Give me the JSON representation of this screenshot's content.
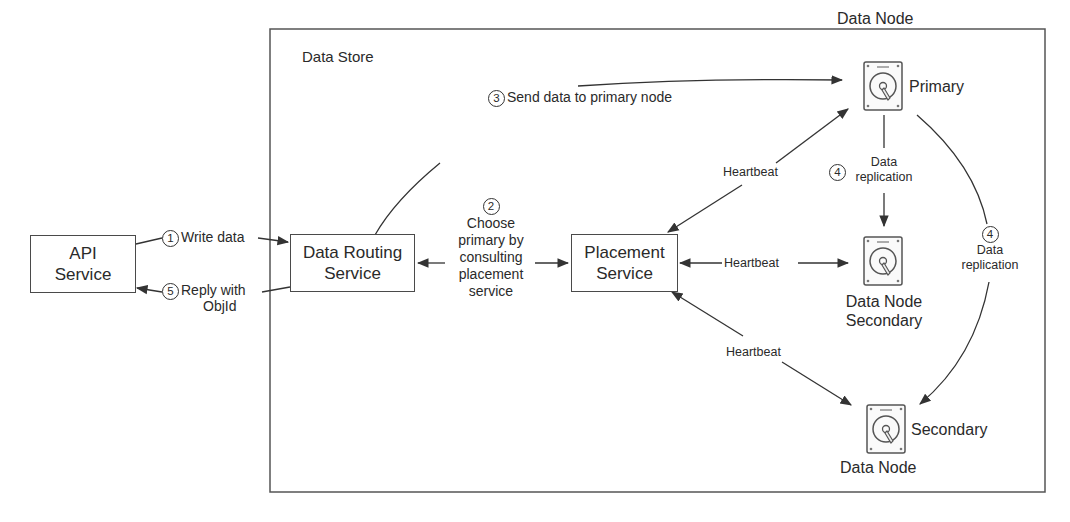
{
  "diagram": {
    "title": "Data Store",
    "nodes": {
      "api_service": {
        "line1": "API",
        "line2": "Service"
      },
      "data_routing": {
        "line1": "Data Routing",
        "line2": "Service"
      },
      "placement": {
        "line1": "Placement",
        "line2": "Service"
      },
      "primary": {
        "title": "Data Node",
        "role": "Primary",
        "icon": "hard-disk-icon"
      },
      "secondary_1": {
        "title": "Data Node",
        "role": "Secondary",
        "icon": "hard-disk-icon"
      },
      "secondary_2": {
        "title": "Data Node",
        "role": "Secondary",
        "icon": "hard-disk-icon"
      }
    },
    "edges": {
      "write": {
        "step": "1",
        "label": "Write data"
      },
      "choose": {
        "step": "2",
        "line1": "Choose",
        "line2": "primary by",
        "line3": "consulting",
        "line4": "placement",
        "line5": "service"
      },
      "send": {
        "step": "3",
        "label": "Send data to primary node"
      },
      "replication_1": {
        "step": "4",
        "line1": "Data",
        "line2": "replication"
      },
      "replication_2": {
        "step": "4",
        "line1": "Data",
        "line2": "replication"
      },
      "reply": {
        "step": "5",
        "line1": "Reply with",
        "line2": "ObjId"
      },
      "heartbeat_primary": {
        "label": "Heartbeat"
      },
      "heartbeat_secondary_1": {
        "label": "Heartbeat"
      },
      "heartbeat_secondary_2": {
        "label": "Heartbeat"
      }
    },
    "colors": {
      "stroke": "#4a4a4a",
      "text": "#2a2a2a",
      "background": "#ffffff"
    }
  }
}
